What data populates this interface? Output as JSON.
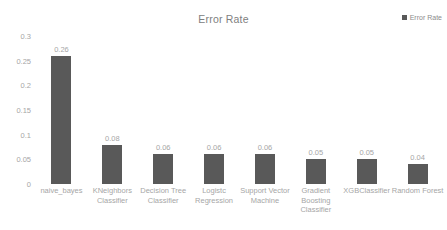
{
  "chart_data": {
    "type": "bar",
    "title": "Error Rate",
    "xlabel": "",
    "ylabel": "",
    "ylim": [
      0,
      0.3
    ],
    "yticks": [
      "0",
      "0.05",
      "0.1",
      "0.15",
      "0.2",
      "0.25",
      "0.3"
    ],
    "ytick_values": [
      0,
      0.05,
      0.1,
      0.15,
      0.2,
      0.25,
      0.3
    ],
    "grid": false,
    "legend_position": "top-right",
    "bar_color": "#595959",
    "text_color": "#a6a6a6",
    "title_color": "#808080",
    "categories": [
      "naive_bayes",
      "KNeighbors Classifier",
      "Decision Tree Classifier",
      "Logistc Regression",
      "Support Vector Machine",
      "Gradient Boosting Classifier",
      "XGBClassifier",
      "Random Forest"
    ],
    "values": [
      0.26,
      0.08,
      0.06,
      0.06,
      0.06,
      0.05,
      0.05,
      0.04
    ],
    "data_labels": [
      "0.26",
      "0.08",
      "0.06",
      "0.06",
      "0.06",
      "0.05",
      "0.05",
      "0.04"
    ],
    "series": [
      {
        "name": "Error Rate",
        "values": [
          0.26,
          0.08,
          0.06,
          0.06,
          0.06,
          0.05,
          0.05,
          0.04
        ]
      }
    ]
  },
  "legend": {
    "entries": [
      {
        "label": "Error Rate",
        "color": "#595959",
        "marker": "square-marker"
      }
    ]
  }
}
